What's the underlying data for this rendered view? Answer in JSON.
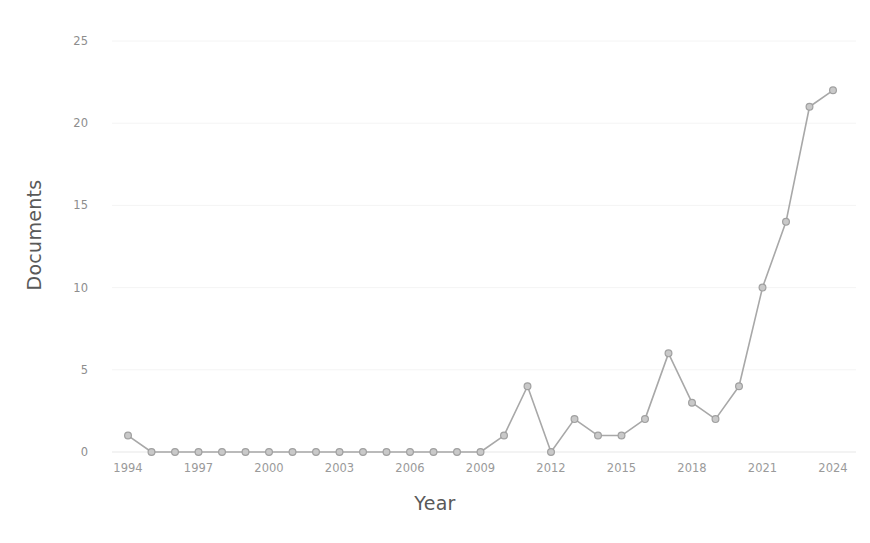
{
  "chart_data": {
    "type": "line",
    "title": "",
    "xlabel": "Year",
    "ylabel": "Documents",
    "x": [
      1994,
      1995,
      1996,
      1997,
      1998,
      1999,
      2000,
      2001,
      2002,
      2003,
      2004,
      2005,
      2006,
      2007,
      2008,
      2009,
      2010,
      2011,
      2012,
      2013,
      2014,
      2015,
      2016,
      2017,
      2018,
      2019,
      2020,
      2021,
      2022,
      2023,
      2024
    ],
    "values": [
      1,
      0,
      0,
      0,
      0,
      0,
      0,
      0,
      0,
      0,
      0,
      0,
      0,
      0,
      0,
      0,
      1,
      4,
      0,
      2,
      1,
      1,
      2,
      6,
      3,
      2,
      4,
      10,
      14,
      21,
      22
    ],
    "series": [
      {
        "name": "Documents",
        "values": [
          1,
          0,
          0,
          0,
          0,
          0,
          0,
          0,
          0,
          0,
          0,
          0,
          0,
          0,
          0,
          0,
          1,
          4,
          0,
          2,
          1,
          1,
          2,
          6,
          3,
          2,
          4,
          10,
          14,
          21,
          22
        ]
      }
    ],
    "xlim": [
      1994,
      2024
    ],
    "ylim": [
      0,
      25
    ],
    "ytick_labels": [
      "0",
      "5",
      "10",
      "15",
      "20",
      "25"
    ],
    "ytick_values": [
      0,
      5,
      10,
      15,
      20,
      25
    ],
    "xtick_labels": [
      "1994",
      "1997",
      "2000",
      "2003",
      "2006",
      "2009",
      "2012",
      "2015",
      "2018",
      "2021",
      "2024"
    ],
    "xtick_values": [
      1994,
      1997,
      2000,
      2003,
      2006,
      2009,
      2012,
      2015,
      2018,
      2021,
      2024
    ],
    "grid": true,
    "legend": false,
    "legend_position": "none",
    "line_color": "#a8a8a8",
    "marker_color": "#c9c9c9",
    "marker_edge_color": "#a0a0a0",
    "grid_color": "#f4f4f4",
    "axis_text_color": "#9a9a9a",
    "axis_label_color": "#595959",
    "background_color": "#ffffff"
  }
}
